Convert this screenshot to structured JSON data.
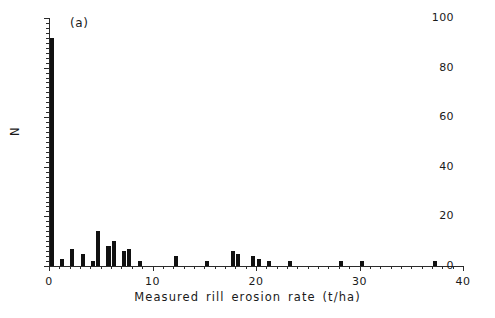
{
  "figure": {
    "panel_label": "(a)",
    "background_color": "#ffffff",
    "ink_color": "#111111"
  },
  "chart_data": {
    "type": "bar",
    "title": "",
    "subtitle": "",
    "panel_label": "(a)",
    "xlabel": "Measured rill erosion rate (t/ha)",
    "ylabel": "N",
    "xlim": [
      0,
      40
    ],
    "ylim": [
      0,
      100
    ],
    "xticks": [
      0,
      10,
      20,
      30,
      40
    ],
    "xtick_labels": [
      "0",
      "10",
      "20",
      "30",
      "40"
    ],
    "yticks": [
      0,
      20,
      40,
      60,
      80,
      100
    ],
    "ytick_labels": [
      "0",
      "20",
      "40",
      "60",
      "80",
      "100"
    ],
    "x_minor_tick_interval": 1,
    "y_minor_tick_interval": 2,
    "grid": false,
    "legend": null,
    "bin_width": 0.5,
    "bar_color": "#111111",
    "x": [
      0.25,
      1.25,
      2.25,
      3.25,
      4.25,
      4.75,
      5.75,
      6.25,
      7.25,
      7.75,
      8.75,
      12.25,
      15.25,
      17.75,
      18.25,
      19.75,
      20.25,
      21.25,
      23.25,
      28.25,
      30.25,
      37.25
    ],
    "values": [
      92,
      3,
      7,
      5,
      2,
      14,
      8,
      10,
      6,
      7,
      2,
      4,
      2,
      6,
      5,
      4,
      3,
      2,
      2,
      2,
      2,
      2
    ],
    "categories": [
      "0.25",
      "1.25",
      "2.25",
      "3.25",
      "4.25",
      "4.75",
      "5.75",
      "6.25",
      "7.25",
      "7.75",
      "8.75",
      "12.25",
      "15.25",
      "17.75",
      "18.25",
      "19.75",
      "20.25",
      "21.25",
      "23.25",
      "28.25",
      "30.25",
      "37.25"
    ]
  }
}
